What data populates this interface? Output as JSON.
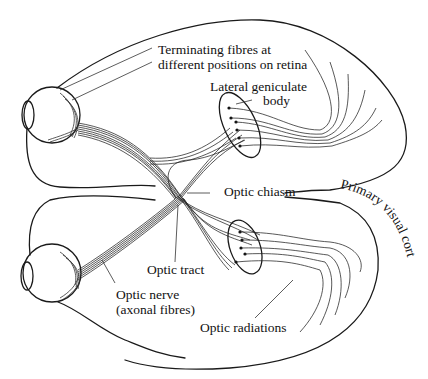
{
  "diagram": {
    "labels": {
      "terminating_fibres": [
        "Terminating fibres at",
        "different positions on retina"
      ],
      "lateral_geniculate": [
        "Lateral geniculate",
        "body"
      ],
      "optic_chiasm": "Optic chiasm",
      "primary_visual_cortex": "Primary visual cortex",
      "optic_tract": "Optic tract",
      "optic_nerve": [
        "Optic nerve",
        "(axonal fibres)"
      ],
      "optic_radiations": "Optic radiations"
    },
    "colors": {
      "line": "#1a1a1a",
      "background": "#ffffff"
    }
  }
}
